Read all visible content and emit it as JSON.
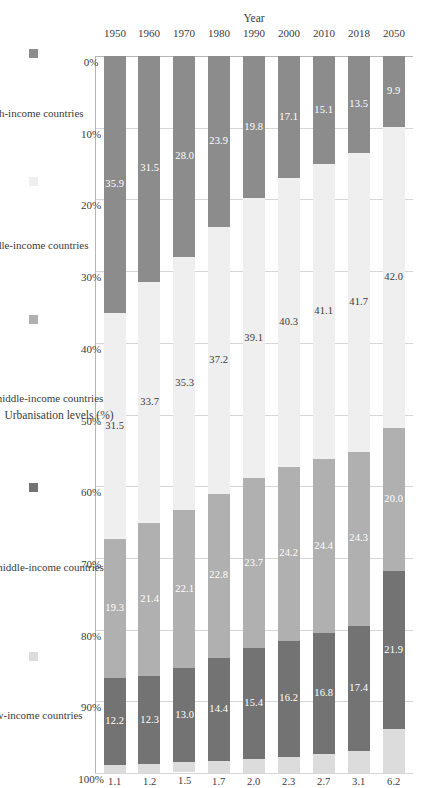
{
  "chart_data": {
    "type": "bar",
    "title": "",
    "subtitle": "",
    "stacked": true,
    "percent_stacked": true,
    "orientation": "horizontal",
    "xlabel": "Urbanisation levels (%)",
    "ylabel": "Year",
    "xlim": [
      0,
      100
    ],
    "xticks": [
      "0%",
      "10%",
      "20%",
      "30%",
      "40%",
      "50%",
      "60%",
      "70%",
      "80%",
      "90%",
      "100%"
    ],
    "xtick_values": [
      0,
      10,
      20,
      30,
      40,
      50,
      60,
      70,
      80,
      90,
      100
    ],
    "grid": true,
    "legend_position": "bottom",
    "categories": [
      "2050",
      "2018",
      "2010",
      "2000",
      "1990",
      "1980",
      "1970",
      "1960",
      "1950"
    ],
    "series": [
      {
        "name": "High-income countries",
        "color": "#8c8c8c",
        "values": [
          9.9,
          13.5,
          15.1,
          17.1,
          19.8,
          23.9,
          28.0,
          31.5,
          35.9
        ]
      },
      {
        "name": "Middle-income countries",
        "color": "#efefef",
        "values": [
          42.0,
          41.7,
          41.1,
          40.3,
          39.1,
          37.2,
          35.3,
          33.7,
          31.5
        ]
      },
      {
        "name": "Upper-middle-income countries",
        "color": "#b0b0b0",
        "values": [
          20.0,
          24.3,
          24.4,
          24.2,
          23.7,
          22.8,
          22.1,
          21.4,
          19.3
        ]
      },
      {
        "name": "Lower-middle-income countries",
        "color": "#737373",
        "values": [
          21.9,
          17.4,
          16.8,
          16.2,
          15.4,
          14.4,
          13.0,
          12.3,
          12.2
        ]
      },
      {
        "name": "Low-income countries",
        "color": "#dcdcdc",
        "values": [
          6.2,
          3.1,
          2.7,
          2.3,
          2.0,
          1.7,
          1.5,
          1.2,
          1.1
        ]
      }
    ],
    "data_labels": [
      [
        "9.9",
        "42.0",
        "20.0",
        "21.9",
        "6.2"
      ],
      [
        "13.5",
        "41.7",
        "24.3",
        "17.4",
        "3.1"
      ],
      [
        "15.1",
        "41.1",
        "24.4",
        "16.8",
        "2.7"
      ],
      [
        "17.1",
        "40.3",
        "24.2",
        "16.2",
        "2.3"
      ],
      [
        "19.8",
        "39.1",
        "23.7",
        "15.4",
        "2.0"
      ],
      [
        "23.9",
        "37.2",
        "22.8",
        "14.4",
        "1.7"
      ],
      [
        "28.0",
        "35.3",
        "22.1",
        "13.0",
        "1.5"
      ],
      [
        "31.5",
        "33.7",
        "21.4",
        "12.3",
        "1.2"
      ],
      [
        "35.9",
        "31.5",
        "19.3",
        "12.2",
        "1.1"
      ]
    ]
  },
  "legend": {
    "row1": [
      {
        "label": "High-income countries",
        "swatch": "c0"
      },
      {
        "label": "Middle-income countries",
        "swatch": "c1"
      },
      {
        "label": "Upper-middle-income countries",
        "swatch": "c2"
      },
      {
        "label": "Lower-middle-income countries",
        "swatch": "c3"
      },
      {
        "label": "Low-income countries",
        "swatch": "c4"
      }
    ]
  }
}
